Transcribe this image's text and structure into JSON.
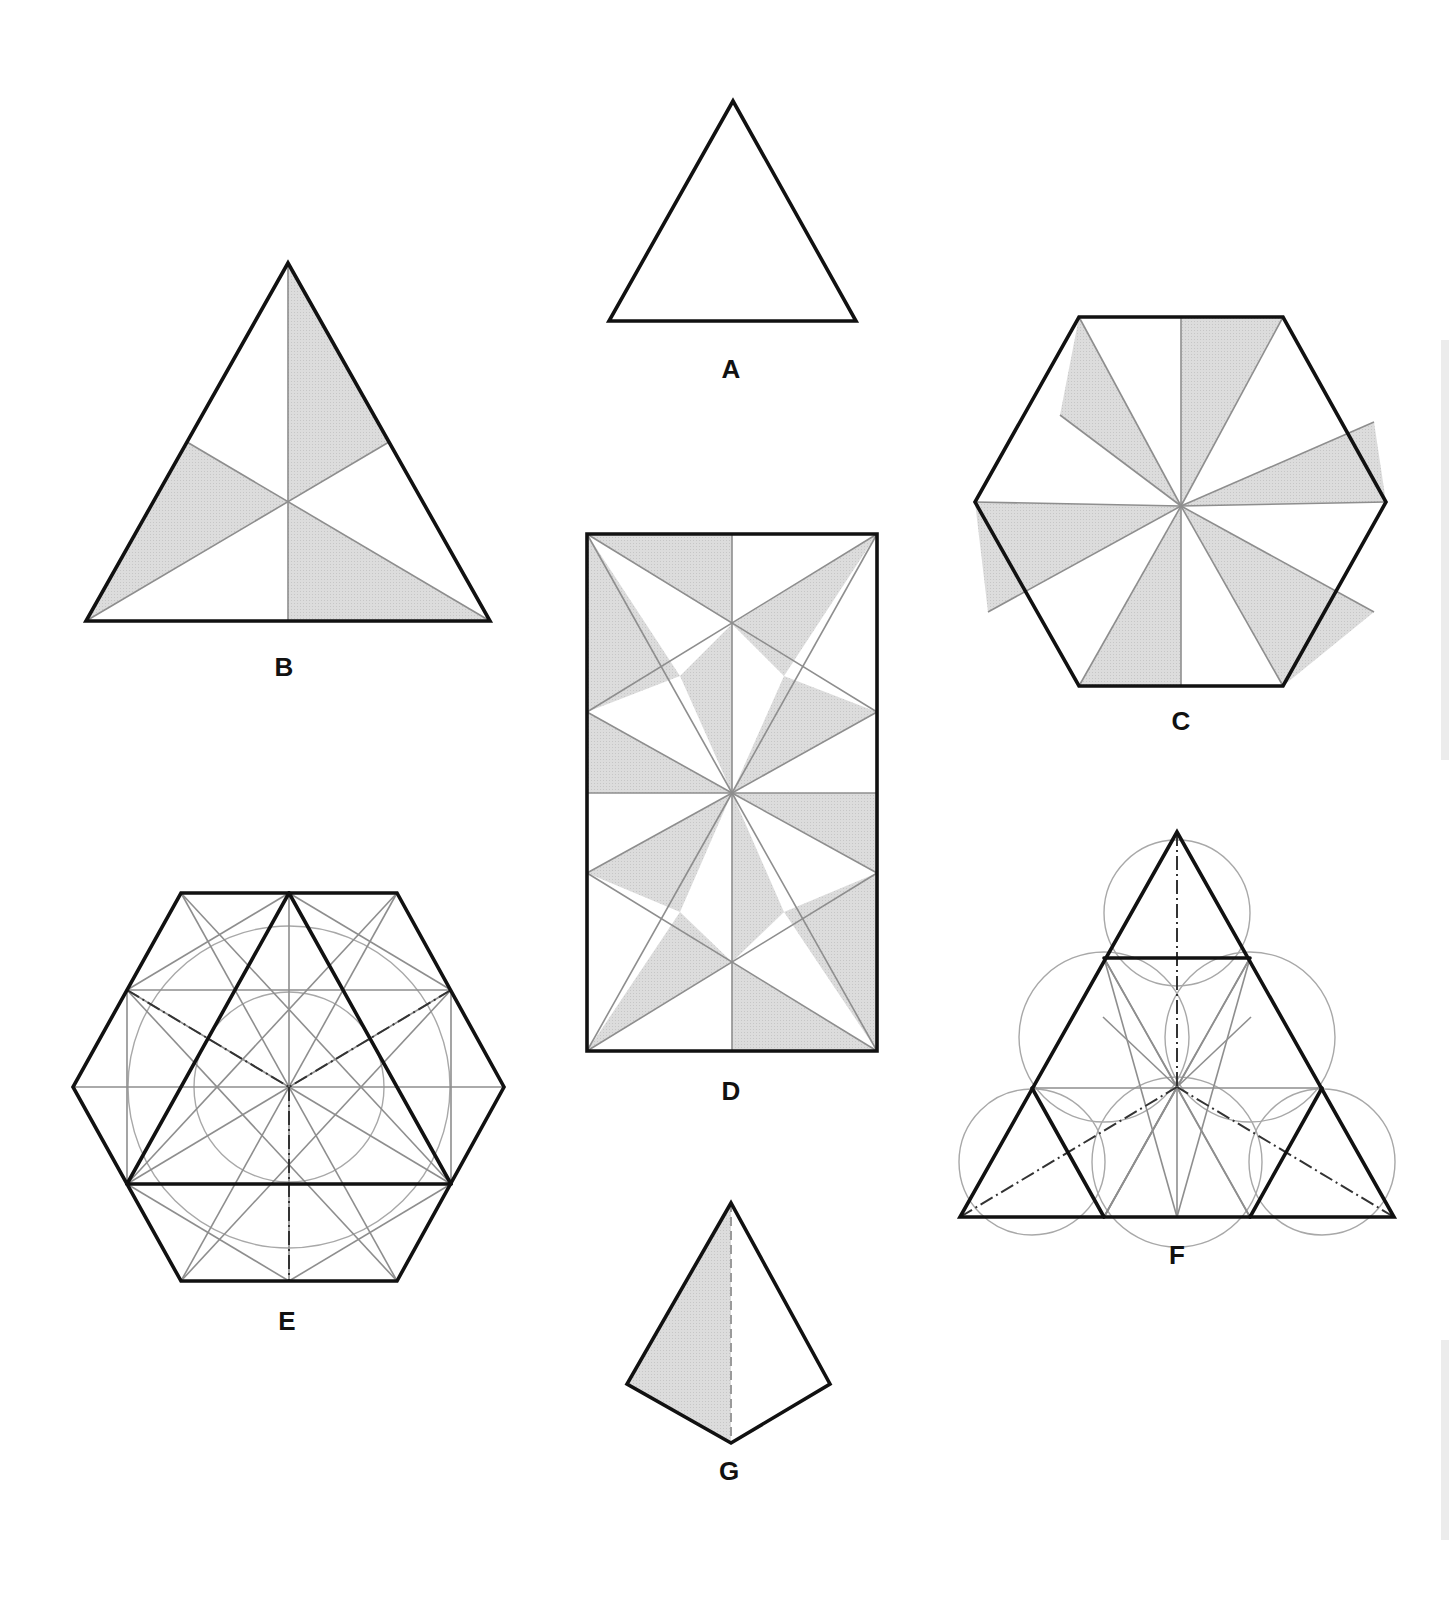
{
  "page": {
    "background": "#ffffff"
  },
  "style": {
    "outline_color": "#111111",
    "outline_width": 3.6,
    "construction_color": "#8e8e8e",
    "construction_width": 1.6,
    "circle_color": "#a8a8a8",
    "circle_width": 1.4,
    "shade_color": "#d9d9d9",
    "dash_color": "#333333"
  },
  "figures": [
    {
      "id": "A",
      "label": "A",
      "description": "Plain equilateral triangle",
      "label_pos": [
        731,
        378
      ],
      "outline": [
        [
          733,
          101
        ],
        [
          609,
          321
        ],
        [
          856,
          321
        ]
      ]
    },
    {
      "id": "B",
      "label": "B",
      "description": "Equilateral triangle divided by three medians into six triangles, alternate three shaded",
      "label_pos": [
        284,
        676
      ],
      "outline": [
        [
          288,
          263
        ],
        [
          86,
          621
        ],
        [
          490,
          621
        ]
      ],
      "centroid": [
        288,
        502
      ],
      "construction_lines": [
        [
          [
            288,
            263
          ],
          [
            288,
            621
          ]
        ],
        [
          [
            86,
            621
          ],
          [
            389,
            442
          ]
        ],
        [
          [
            490,
            621
          ],
          [
            187,
            442
          ]
        ]
      ],
      "shaded": [
        [
          [
            288,
            263
          ],
          [
            288,
            502
          ],
          [
            389,
            442
          ]
        ],
        [
          [
            86,
            621
          ],
          [
            187,
            442
          ],
          [
            288,
            502
          ]
        ],
        [
          [
            288,
            502
          ],
          [
            288,
            621
          ],
          [
            490,
            621
          ]
        ]
      ]
    },
    {
      "id": "C",
      "label": "C",
      "description": "Regular hexagon divided into twelve pinwheel triangles from centre, alternate six shaded",
      "label_pos": [
        1181,
        730
      ],
      "center": [
        1181,
        506
      ],
      "outline": [
        [
          1079,
          317
        ],
        [
          1283,
          317
        ],
        [
          1386,
          502
        ],
        [
          1283,
          686
        ],
        [
          1079,
          686
        ],
        [
          975,
          502
        ]
      ],
      "spoke_ends": [
        [
          1181,
          317
        ],
        [
          1283,
          317
        ],
        [
          1374,
          422
        ],
        [
          1386,
          502
        ],
        [
          1374,
          612
        ],
        [
          1283,
          686
        ],
        [
          1181,
          686
        ],
        [
          1079,
          686
        ],
        [
          988,
          612
        ],
        [
          975,
          502
        ],
        [
          1060,
          415
        ],
        [
          1079,
          317
        ]
      ],
      "shaded": [
        [
          [
            1181,
            506
          ],
          [
            1181,
            317
          ],
          [
            1283,
            317
          ]
        ],
        [
          [
            1181,
            506
          ],
          [
            1374,
            422
          ],
          [
            1386,
            502
          ]
        ],
        [
          [
            1181,
            506
          ],
          [
            1374,
            612
          ],
          [
            1283,
            686
          ]
        ],
        [
          [
            1181,
            506
          ],
          [
            1181,
            686
          ],
          [
            1079,
            686
          ]
        ],
        [
          [
            1181,
            506
          ],
          [
            988,
            612
          ],
          [
            975,
            502
          ]
        ],
        [
          [
            1181,
            506
          ],
          [
            1060,
            415
          ],
          [
            1079,
            317
          ]
        ]
      ]
    },
    {
      "id": "D",
      "label": "D",
      "description": "Rectangle subdivided into a pinwheel/star pattern of shaded and white triangles",
      "label_pos": [
        731,
        1100
      ],
      "outline": [
        [
          587,
          534
        ],
        [
          877,
          534
        ],
        [
          877,
          1051
        ],
        [
          587,
          1051
        ]
      ],
      "center": [
        732,
        793
      ],
      "construction_lines": [
        [
          [
            732,
            534
          ],
          [
            732,
            1051
          ]
        ],
        [
          [
            587,
            793
          ],
          [
            877,
            793
          ]
        ],
        [
          [
            587,
            534
          ],
          [
            877,
            712
          ]
        ],
        [
          [
            877,
            534
          ],
          [
            587,
            712
          ]
        ],
        [
          [
            587,
            1051
          ],
          [
            877,
            873
          ]
        ],
        [
          [
            877,
            1051
          ],
          [
            587,
            873
          ]
        ],
        [
          [
            587,
            534
          ],
          [
            732,
            793
          ]
        ],
        [
          [
            877,
            534
          ],
          [
            732,
            793
          ]
        ],
        [
          [
            587,
            1051
          ],
          [
            732,
            793
          ]
        ],
        [
          [
            877,
            1051
          ],
          [
            732,
            793
          ]
        ],
        [
          [
            587,
            712
          ],
          [
            732,
            793
          ]
        ],
        [
          [
            877,
            712
          ],
          [
            732,
            793
          ]
        ],
        [
          [
            587,
            873
          ],
          [
            732,
            793
          ]
        ],
        [
          [
            877,
            873
          ],
          [
            732,
            793
          ]
        ]
      ],
      "shaded": [
        [
          [
            587,
            534
          ],
          [
            732,
            534
          ],
          [
            732,
            624
          ]
        ],
        [
          [
            587,
            534
          ],
          [
            587,
            712
          ],
          [
            680,
            676
          ]
        ],
        [
          [
            680,
            676
          ],
          [
            732,
            624
          ],
          [
            732,
            793
          ]
        ],
        [
          [
            732,
            624
          ],
          [
            877,
            534
          ],
          [
            784,
            676
          ]
        ],
        [
          [
            784,
            676
          ],
          [
            877,
            712
          ],
          [
            732,
            793
          ]
        ],
        [
          [
            587,
            712
          ],
          [
            587,
            793
          ],
          [
            732,
            793
          ]
        ],
        [
          [
            732,
            793
          ],
          [
            877,
            793
          ],
          [
            877,
            873
          ]
        ],
        [
          [
            587,
            873
          ],
          [
            732,
            793
          ],
          [
            680,
            912
          ]
        ],
        [
          [
            732,
            793
          ],
          [
            732,
            962
          ],
          [
            784,
            912
          ]
        ],
        [
          [
            877,
            873
          ],
          [
            877,
            1051
          ],
          [
            784,
            912
          ]
        ],
        [
          [
            587,
            1051
          ],
          [
            680,
            912
          ],
          [
            732,
            962
          ]
        ],
        [
          [
            732,
            962
          ],
          [
            732,
            1051
          ],
          [
            877,
            1051
          ]
        ]
      ]
    },
    {
      "id": "E",
      "label": "E",
      "description": "Regular hexagon with inscribed equilateral triangle, construction circles and radiating lines, dash-dot axes",
      "label_pos": [
        287,
        1330
      ],
      "center": [
        289,
        1087
      ],
      "outline": [
        [
          181,
          893
        ],
        [
          397,
          893
        ],
        [
          504,
          1087
        ],
        [
          397,
          1281
        ],
        [
          181,
          1281
        ],
        [
          73,
          1087
        ]
      ],
      "bold_lines": [
        [
          [
            289,
            893
          ],
          [
            127,
            1184
          ]
        ],
        [
          [
            289,
            893
          ],
          [
            451,
            1184
          ]
        ],
        [
          [
            127,
            1184
          ],
          [
            451,
            1184
          ]
        ]
      ],
      "circles": [
        {
          "cx": 289,
          "cy": 1087,
          "r": 161
        },
        {
          "cx": 289,
          "cy": 1087,
          "r": 95
        }
      ],
      "construction_lines": [
        [
          [
            73,
            1087
          ],
          [
            504,
            1087
          ]
        ],
        [
          [
            289,
            893
          ],
          [
            289,
            1281
          ]
        ],
        [
          [
            127,
            990
          ],
          [
            451,
            990
          ]
        ],
        [
          [
            127,
            990
          ],
          [
            127,
            1184
          ]
        ],
        [
          [
            451,
            990
          ],
          [
            451,
            1184
          ]
        ],
        [
          [
            181,
            893
          ],
          [
            397,
            1281
          ]
        ],
        [
          [
            397,
            893
          ],
          [
            181,
            1281
          ]
        ],
        [
          [
            127,
            990
          ],
          [
            289,
            893
          ]
        ],
        [
          [
            451,
            990
          ],
          [
            289,
            893
          ]
        ],
        [
          [
            127,
            990
          ],
          [
            397,
            1281
          ]
        ],
        [
          [
            451,
            990
          ],
          [
            181,
            1281
          ]
        ],
        [
          [
            127,
            1184
          ],
          [
            397,
            893
          ]
        ],
        [
          [
            451,
            1184
          ],
          [
            181,
            893
          ]
        ],
        [
          [
            127,
            1184
          ],
          [
            289,
            1281
          ]
        ],
        [
          [
            451,
            1184
          ],
          [
            289,
            1281
          ]
        ],
        [
          [
            127,
            1184
          ],
          [
            451,
            990
          ]
        ],
        [
          [
            451,
            1184
          ],
          [
            127,
            990
          ]
        ]
      ],
      "dash_lines": [
        [
          [
            127,
            990
          ],
          [
            289,
            1087
          ]
        ],
        [
          [
            451,
            990
          ],
          [
            289,
            1087
          ]
        ],
        [
          [
            289,
            1087
          ],
          [
            289,
            1281
          ]
        ]
      ]
    },
    {
      "id": "F",
      "label": "F",
      "description": "Large equilateral triangle subdivided into four triangles with overlapping construction circles forming a rosette, dash-dot medians",
      "label_pos": [
        1177,
        1264
      ],
      "center": [
        1177,
        1087
      ],
      "outline": [
        [
          1177,
          832
        ],
        [
          960,
          1217
        ],
        [
          1394,
          1217
        ]
      ],
      "bold_lines": [
        [
          [
            1104,
            958
          ],
          [
            1250,
            958
          ]
        ],
        [
          [
            1032,
            1088
          ],
          [
            1104,
            1217
          ]
        ],
        [
          [
            1322,
            1088
          ],
          [
            1250,
            1217
          ]
        ]
      ],
      "circles": [
        {
          "cx": 1177,
          "cy": 913,
          "r": 73
        },
        {
          "cx": 1032,
          "cy": 1162,
          "r": 73
        },
        {
          "cx": 1322,
          "cy": 1162,
          "r": 73
        },
        {
          "cx": 1104,
          "cy": 1037,
          "r": 85
        },
        {
          "cx": 1250,
          "cy": 1037,
          "r": 85
        },
        {
          "cx": 1177,
          "cy": 1162,
          "r": 85
        }
      ],
      "construction_lines": [
        [
          [
            1032,
            1088
          ],
          [
            1322,
            1088
          ]
        ],
        [
          [
            1104,
            958
          ],
          [
            1177,
            1087
          ]
        ],
        [
          [
            1250,
            958
          ],
          [
            1177,
            1087
          ]
        ],
        [
          [
            1104,
            1217
          ],
          [
            1177,
            1087
          ]
        ],
        [
          [
            1250,
            1217
          ],
          [
            1177,
            1087
          ]
        ],
        [
          [
            1104,
            958
          ],
          [
            1250,
            1217
          ]
        ],
        [
          [
            1250,
            958
          ],
          [
            1104,
            1217
          ]
        ],
        [
          [
            1104,
            1217
          ],
          [
            1177,
            1087
          ]
        ],
        [
          [
            1177,
            1087
          ],
          [
            1177,
            1217
          ]
        ],
        [
          [
            1104,
            958
          ],
          [
            1177,
            1217
          ]
        ],
        [
          [
            1250,
            958
          ],
          [
            1177,
            1217
          ]
        ],
        [
          [
            1103,
            1017
          ],
          [
            1177,
            1087
          ]
        ],
        [
          [
            1251,
            1017
          ],
          [
            1177,
            1087
          ]
        ]
      ],
      "dash_lines": [
        [
          [
            1177,
            832
          ],
          [
            1177,
            1087
          ]
        ],
        [
          [
            960,
            1217
          ],
          [
            1177,
            1087
          ]
        ],
        [
          [
            1394,
            1217
          ],
          [
            1177,
            1087
          ]
        ]
      ]
    },
    {
      "id": "G",
      "label": "G",
      "description": "Tetrahedron (triangular pyramid) view with one shaded face and dashed hidden edge",
      "label_pos": [
        729,
        1480
      ],
      "outline": [
        [
          731,
          1203
        ],
        [
          627,
          1384
        ],
        [
          731,
          1443
        ],
        [
          830,
          1384
        ]
      ],
      "shaded": [
        [
          [
            731,
            1203
          ],
          [
            627,
            1384
          ],
          [
            731,
            1443
          ]
        ]
      ],
      "dash_lines": [
        [
          [
            731,
            1203
          ],
          [
            731,
            1443
          ]
        ]
      ]
    }
  ]
}
